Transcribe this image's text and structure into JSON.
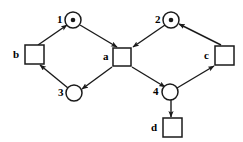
{
  "diagram": {
    "type": "petri-net",
    "title": "",
    "background_color": "#ffffff",
    "stroke_color": "#1a1a1a"
  },
  "places": [
    {
      "id": "p1",
      "label": "1",
      "cx": 73,
      "cy": 20,
      "r": 8,
      "tokens": 1,
      "label_x": 57,
      "label_y": 14
    },
    {
      "id": "p2",
      "label": "2",
      "cx": 171,
      "cy": 20,
      "r": 8,
      "tokens": 1,
      "label_x": 155,
      "label_y": 14
    },
    {
      "id": "p3",
      "label": "3",
      "cx": 74,
      "cy": 93,
      "r": 8,
      "tokens": 0,
      "label_x": 58,
      "label_y": 87
    },
    {
      "id": "p4",
      "label": "4",
      "cx": 170,
      "cy": 92,
      "r": 8,
      "tokens": 0,
      "label_x": 153,
      "label_y": 86
    }
  ],
  "transitions": [
    {
      "id": "tb",
      "label": "b",
      "x": 25,
      "y": 45,
      "w": 19,
      "h": 19,
      "label_x": 13,
      "label_y": 49
    },
    {
      "id": "ta",
      "label": "a",
      "x": 113,
      "y": 48,
      "w": 18,
      "h": 18,
      "label_x": 103,
      "label_y": 51
    },
    {
      "id": "tc",
      "label": "c",
      "x": 215,
      "y": 46,
      "w": 19,
      "h": 19,
      "label_x": 204,
      "label_y": 50
    },
    {
      "id": "td",
      "label": "d",
      "x": 163,
      "y": 118,
      "w": 19,
      "h": 19,
      "label_x": 151,
      "label_y": 122
    }
  ],
  "arcs": [
    {
      "id": "arc-b-to-1",
      "from": "tb",
      "to": "p1",
      "x1": 38,
      "y1": 45,
      "x2": 67,
      "y2": 25
    },
    {
      "id": "arc-1-to-a",
      "from": "p1",
      "to": "ta",
      "x1": 80,
      "y1": 25,
      "x2": 117,
      "y2": 47
    },
    {
      "id": "arc-a-to-3",
      "from": "ta",
      "to": "p3",
      "x1": 112,
      "y1": 67,
      "x2": 82,
      "y2": 89
    },
    {
      "id": "arc-3-to-b",
      "from": "p3",
      "to": "tb",
      "x1": 68,
      "y1": 88,
      "x2": 40,
      "y2": 65
    },
    {
      "id": "arc-c-to-2",
      "from": "tc",
      "to": "p2",
      "x1": 221,
      "y1": 45,
      "x2": 179,
      "y2": 24
    },
    {
      "id": "arc-2-to-a",
      "from": "p2",
      "to": "ta",
      "x1": 165,
      "y1": 25,
      "x2": 133,
      "y2": 47
    },
    {
      "id": "arc-a-to-4",
      "from": "ta",
      "to": "p4",
      "x1": 132,
      "y1": 67,
      "x2": 165,
      "y2": 87
    },
    {
      "id": "arc-4-to-c",
      "from": "p4",
      "to": "tc",
      "x1": 177,
      "y1": 88,
      "x2": 214,
      "y2": 66
    },
    {
      "id": "arc-4-to-d",
      "from": "p4",
      "to": "td",
      "x1": 171,
      "y1": 100,
      "x2": 171,
      "y2": 117
    }
  ]
}
